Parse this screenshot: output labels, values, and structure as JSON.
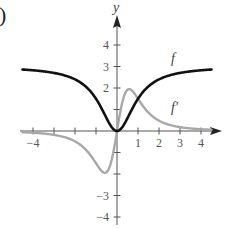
{
  "panel_label": ")",
  "axes": {
    "x_label": "",
    "y_label": "y",
    "x_tick_labels": [
      "-4",
      "1",
      "2",
      "3",
      "4"
    ],
    "y_tick_labels": [
      "4",
      "3",
      "2",
      "-3",
      "-4"
    ]
  },
  "curve_labels": {
    "f": "f",
    "f_prime": "f′"
  },
  "colors": {
    "f": "#111111",
    "f_prime": "#a8a8a8",
    "axis": "#555555"
  },
  "chart_data": {
    "type": "line",
    "title": "",
    "xlabel": "",
    "ylabel": "y",
    "xlim": [
      -4.5,
      4.7
    ],
    "ylim": [
      -4.3,
      4.8
    ],
    "grid": false,
    "legend": "inline labels",
    "x_ticks": [
      -4,
      -3,
      -2,
      -1,
      1,
      2,
      3,
      4
    ],
    "y_ticks": [
      -4,
      -3,
      -2,
      -1,
      1,
      2,
      3,
      4
    ],
    "labeled_x_ticks": [
      -4,
      1,
      2,
      3,
      4
    ],
    "labeled_y_ticks": [
      -4,
      -3,
      2,
      3,
      4
    ],
    "series": [
      {
        "name": "f",
        "style": "black thick",
        "x": [
          -4.5,
          -4,
          -3,
          -2,
          -1.5,
          -1,
          -0.5,
          0,
          0.5,
          1,
          1.5,
          2,
          3,
          4,
          4.5
        ],
        "y": [
          2.86,
          2.82,
          2.7,
          2.4,
          2.08,
          1.5,
          0.6,
          0,
          0.6,
          1.5,
          2.08,
          2.4,
          2.7,
          2.82,
          2.86
        ]
      },
      {
        "name": "f'",
        "style": "gray thick",
        "x": [
          -4.5,
          -4,
          -3,
          -2,
          -1.5,
          -1,
          -0.58,
          -0.3,
          0,
          0.3,
          0.58,
          1,
          1.5,
          2,
          3,
          4,
          4.5
        ],
        "y": [
          -0.06,
          -0.08,
          -0.18,
          -0.48,
          -0.85,
          -1.5,
          -1.95,
          -1.5,
          0,
          1.5,
          1.95,
          1.5,
          0.85,
          0.48,
          0.18,
          0.08,
          0.06
        ]
      }
    ],
    "annotations": [
      {
        "text": "f",
        "x": 2.6,
        "y": 3.5
      },
      {
        "text": "f'",
        "x": 2.6,
        "y": 1.0
      }
    ]
  }
}
